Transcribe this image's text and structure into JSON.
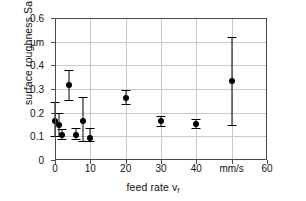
{
  "chart_data": {
    "type": "scatter",
    "title": "",
    "xlabel": "feed rate v",
    "xlabel_sub": "f",
    "ylabel": "surface roughness Sa",
    "xlim": [
      0,
      60
    ],
    "ylim": [
      0,
      0.6
    ],
    "grid": true,
    "legend": null,
    "x_unit": "mm/s",
    "y_unit": "µm",
    "x_unit_at": 50,
    "y_unit_at": 0.5,
    "xticks": [
      0,
      10,
      20,
      30,
      40,
      50,
      60
    ],
    "xtick_labels": [
      "0",
      "10",
      "20",
      "30",
      "40",
      "mm/s",
      "60"
    ],
    "yticks": [
      0,
      0.1,
      0.2,
      0.3,
      0.4,
      0.5,
      0.6
    ],
    "ytick_labels": [
      "0",
      "0.1",
      "0.2",
      "0.3",
      "0.4",
      "µm",
      "0.6"
    ],
    "marker": "filled-circle",
    "marker_color": "#000000",
    "errorbar_color": "#000000",
    "points": [
      {
        "x": 0.0,
        "y": 0.165,
        "lo": 0.1,
        "hi": 0.245
      },
      {
        "x": 1.0,
        "y": 0.15,
        "lo": 0.1,
        "hi": 0.2
      },
      {
        "x": 2.0,
        "y": 0.105,
        "lo": 0.09,
        "hi": 0.13
      },
      {
        "x": 4.0,
        "y": 0.315,
        "lo": 0.255,
        "hi": 0.38
      },
      {
        "x": 6.0,
        "y": 0.105,
        "lo": 0.09,
        "hi": 0.135
      },
      {
        "x": 8.0,
        "y": 0.165,
        "lo": 0.08,
        "hi": 0.265
      },
      {
        "x": 10.0,
        "y": 0.095,
        "lo": 0.08,
        "hi": 0.135
      },
      {
        "x": 20.0,
        "y": 0.26,
        "lo": 0.235,
        "hi": 0.295
      },
      {
        "x": 30.0,
        "y": 0.163,
        "lo": 0.145,
        "hi": 0.185
      },
      {
        "x": 40.0,
        "y": 0.152,
        "lo": 0.135,
        "hi": 0.175
      },
      {
        "x": 50.0,
        "y": 0.332,
        "lo": 0.147,
        "hi": 0.518
      }
    ]
  }
}
